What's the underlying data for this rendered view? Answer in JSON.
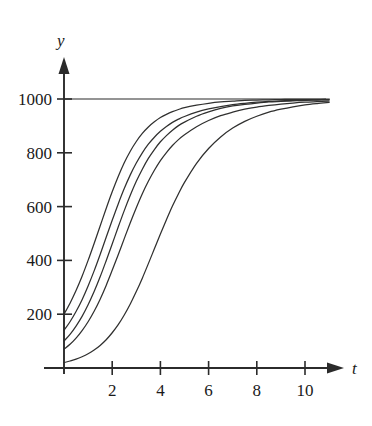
{
  "chart_data": {
    "type": "line",
    "title": "",
    "subtitle": "",
    "xlabel": "t",
    "ylabel": "y",
    "xlim": [
      0,
      11.6
    ],
    "ylim": [
      0,
      1100
    ],
    "grid": false,
    "legend": "none",
    "annotations": [
      {
        "name": "asymptote",
        "label": "",
        "y": 1000,
        "style": "horizontal-line"
      }
    ],
    "x_ticks": [
      {
        "value": 2,
        "label": "2"
      },
      {
        "value": 4,
        "label": "4"
      },
      {
        "value": 6,
        "label": "6"
      },
      {
        "value": 8,
        "label": "8"
      },
      {
        "value": 10,
        "label": "10"
      }
    ],
    "y_ticks": [
      {
        "value": 200,
        "label": "200"
      },
      {
        "value": 400,
        "label": "400"
      },
      {
        "value": 600,
        "label": "600"
      },
      {
        "value": 800,
        "label": "800"
      },
      {
        "value": 1000,
        "label": "1000"
      }
    ],
    "carrying_capacity": 1000,
    "x": [
      0,
      0.25,
      0.5,
      0.75,
      1,
      1.25,
      1.5,
      1.75,
      2,
      2.25,
      2.5,
      2.75,
      3,
      3.25,
      3.5,
      3.75,
      4,
      4.25,
      4.5,
      4.75,
      5,
      5.5,
      6,
      6.5,
      7,
      7.5,
      8,
      8.5,
      9,
      9.5,
      10,
      10.5,
      11,
      11.5
    ],
    "series": [
      {
        "name": "curve-1",
        "y0": 200,
        "values": [
          200,
          241,
          288,
          341,
          400,
          463,
          528,
          593,
          655,
          712,
          763,
          806,
          842,
          872,
          896,
          915,
          931,
          943,
          953,
          961,
          968,
          977,
          984,
          989,
          992,
          995,
          996,
          997,
          998,
          999,
          999,
          999,
          1000,
          1000
        ]
      },
      {
        "name": "curve-2",
        "y0": 140,
        "values": [
          140,
          172,
          210,
          254,
          305,
          361,
          422,
          486,
          549,
          610,
          667,
          718,
          762,
          800,
          832,
          858,
          880,
          898,
          913,
          925,
          935,
          951,
          963,
          972,
          979,
          984,
          988,
          991,
          993,
          995,
          996,
          997,
          998,
          998
        ]
      },
      {
        "name": "curve-3",
        "y0": 100,
        "values": [
          100,
          125,
          156,
          192,
          235,
          284,
          339,
          399,
          461,
          524,
          585,
          642,
          694,
          739,
          779,
          812,
          841,
          864,
          884,
          901,
          914,
          936,
          952,
          965,
          974,
          980,
          985,
          989,
          991,
          993,
          995,
          996,
          997,
          998
        ]
      },
      {
        "name": "curve-4",
        "y0": 70,
        "values": [
          70,
          88,
          111,
          139,
          172,
          211,
          256,
          307,
          363,
          421,
          481,
          540,
          596,
          648,
          694,
          735,
          771,
          801,
          827,
          849,
          867,
          897,
          920,
          938,
          951,
          962,
          970,
          976,
          981,
          985,
          988,
          990,
          992,
          994
        ]
      },
      {
        "name": "curve-5",
        "y0": 20,
        "values": [
          20,
          26,
          33,
          42,
          53,
          67,
          84,
          105,
          131,
          161,
          197,
          238,
          284,
          334,
          388,
          443,
          498,
          551,
          602,
          648,
          690,
          761,
          816,
          859,
          892,
          917,
          936,
          951,
          962,
          971,
          978,
          983,
          987,
          990
        ]
      }
    ]
  },
  "axis_labels": {
    "y": "y",
    "t": "t"
  },
  "colors": {
    "curve": "#30302f",
    "axis": "#2b2b2b",
    "background": "#ffffff"
  }
}
